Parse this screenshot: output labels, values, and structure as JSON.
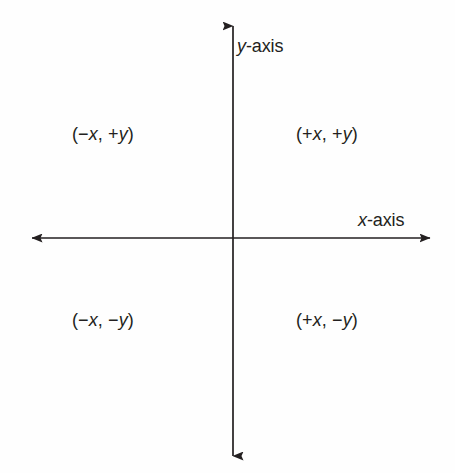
{
  "figure": {
    "type": "cartesian-coordinate-plane-quadrant-signs",
    "background_color": "#fefefe",
    "line_color": "#231f20",
    "text_color": "#231f20"
  },
  "axes": {
    "x": {
      "label_variable": "x",
      "label_suffix": "-axis",
      "label_full": "x-axis",
      "orientation": "horizontal",
      "arrow_start": "left",
      "arrow_end": "right",
      "y_position_px": 238,
      "x_start_px": 30,
      "x_end_px": 432
    },
    "y": {
      "label_variable": "y",
      "label_suffix": "-axis",
      "label_full": "y-axis",
      "orientation": "vertical",
      "arrow_start": "up",
      "arrow_end": "down",
      "x_position_px": 233,
      "y_start_px": 24,
      "y_end_px": 458
    },
    "origin": {
      "x_px": 233,
      "y_px": 238
    }
  },
  "quadrants": [
    {
      "id": "quadrant-1",
      "position": "top-right",
      "open_paren": "(",
      "x_sign": "+",
      "x_variable": "x",
      "separator": ", ",
      "y_sign": "+",
      "y_variable": "y",
      "close_paren": ")",
      "label_full": "(+x, +y)"
    },
    {
      "id": "quadrant-2",
      "position": "top-left",
      "open_paren": "(",
      "x_sign": "−",
      "x_variable": "x",
      "separator": ", ",
      "y_sign": "+",
      "y_variable": "y",
      "close_paren": ")",
      "label_full": "(−x, +y)"
    },
    {
      "id": "quadrant-3",
      "position": "bottom-left",
      "open_paren": "(",
      "x_sign": "−",
      "x_variable": "x",
      "separator": ", ",
      "y_sign": "−",
      "y_variable": "y",
      "close_paren": ")",
      "label_full": "(−x, −y)"
    },
    {
      "id": "quadrant-4",
      "position": "bottom-right",
      "open_paren": "(",
      "x_sign": "+",
      "x_variable": "x",
      "separator": ", ",
      "y_sign": "−",
      "y_variable": "y",
      "close_paren": ")",
      "label_full": "(+x, −y)"
    }
  ]
}
